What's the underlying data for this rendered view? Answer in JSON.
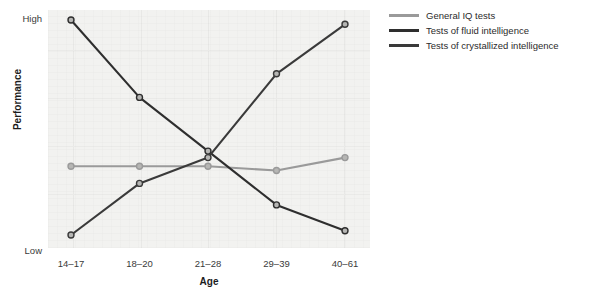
{
  "chart_data": {
    "type": "line",
    "title": "",
    "xlabel": "Age",
    "ylabel": "Performance",
    "categories": [
      "14–17",
      "18–20",
      "21–28",
      "29–39",
      "40–61"
    ],
    "ylim": [
      0,
      100
    ],
    "ytick_labels": [
      "Low",
      "High"
    ],
    "grid": true,
    "legend_position": "right",
    "series": [
      {
        "name": "General IQ tests",
        "color": "#9a9a9a",
        "values": [
          32,
          32,
          32,
          30,
          36
        ]
      },
      {
        "name": "Tests of fluid intelligence",
        "color": "#2e2e2e",
        "values": [
          100,
          64,
          39,
          14,
          2
        ]
      },
      {
        "name": "Tests of crystallized intelligence",
        "color": "#3a3a3a",
        "values": [
          0,
          24,
          36,
          75,
          98
        ]
      }
    ]
  },
  "axis": {
    "y_high_label": "High",
    "y_low_label": "Low",
    "y_title": "Performance",
    "x_title": "Age"
  },
  "legend": {
    "items": [
      {
        "label": "General IQ tests",
        "color": "#9a9a9a"
      },
      {
        "label": "Tests of fluid intelligence",
        "color": "#2e2e2e"
      },
      {
        "label": "Tests of crystallized intelligence",
        "color": "#3a3a3a"
      }
    ]
  }
}
